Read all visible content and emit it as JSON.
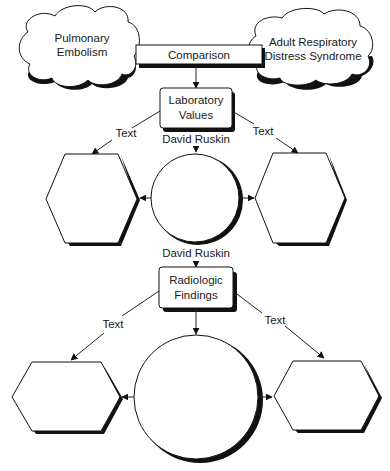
{
  "diagram": {
    "clouds": [
      {
        "id": "pulmonary-embolism",
        "lines": [
          "Pulmonary",
          "Embolism"
        ]
      },
      {
        "id": "ards",
        "lines": [
          "Adult Respiratory",
          "Distress Syndrome"
        ]
      }
    ],
    "comparison_label": "Comparison",
    "lab_node": {
      "lines": [
        "Laboratory",
        "Values"
      ]
    },
    "radio_node": {
      "lines": [
        "Radiologic",
        "Findings"
      ]
    },
    "edge_labels": {
      "lab_left": "Text",
      "lab_right": "Text",
      "lab_to_circle": "David Ruskin",
      "circle_to_radio": "David Ruskin",
      "radio_left": "Text",
      "radio_right": "Text"
    },
    "colors": {
      "stroke": "#111111",
      "background": "#ffffff",
      "text": "#1a1a1a"
    }
  }
}
